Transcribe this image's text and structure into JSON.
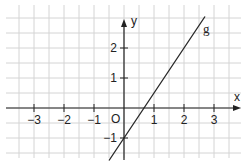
{
  "chart_data": {
    "type": "line",
    "title": "",
    "xlabel": "x",
    "ylabel": "y",
    "origin_label": "O",
    "xlim": [
      -3.9,
      3.9
    ],
    "ylim": [
      -1.6,
      3.4
    ],
    "grid": true,
    "grid_step": 0.5,
    "x_ticks": [
      -3,
      -2,
      -1,
      1,
      2,
      3
    ],
    "x_tick_labels": [
      "−3",
      "−2",
      "−1",
      "1",
      "2",
      "3"
    ],
    "y_ticks": [
      -1,
      1,
      2
    ],
    "y_tick_labels": [
      "−1",
      "1",
      "2"
    ],
    "series": [
      {
        "name": "g",
        "label": "g",
        "equation": "y = 1.5x − 1",
        "slope": 1.5,
        "intercept": -1,
        "x_range": [
          -0.5,
          2.7
        ],
        "points": [
          [
            -0.5,
            -1.75
          ],
          [
            0,
            -1
          ],
          [
            0.667,
            0
          ],
          [
            1,
            0.5
          ],
          [
            2,
            2
          ],
          [
            2.7,
            3.05
          ]
        ],
        "color": "#222222"
      }
    ],
    "legend": "none (line labeled inline as g)"
  },
  "colors": {
    "grid": "#d4d4d4",
    "axis": "#222222",
    "line": "#222222",
    "background": "#ffffff"
  }
}
